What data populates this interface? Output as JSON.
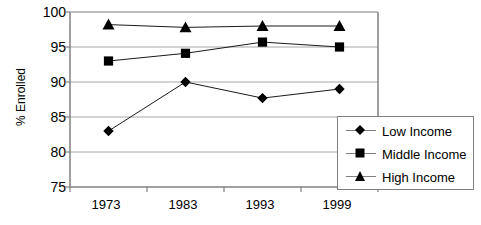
{
  "chart_data": {
    "type": "line",
    "title": "",
    "xlabel": "",
    "ylabel": "% Enrolled",
    "categories": [
      "1973",
      "1983",
      "1993",
      "1999"
    ],
    "ylim": [
      75,
      100
    ],
    "yticks": [
      75,
      80,
      85,
      90,
      95,
      100
    ],
    "ytick_labels": [
      "75",
      "80",
      "85",
      "90",
      "95",
      "100"
    ],
    "grid": true,
    "legend_position": "bottom-right",
    "series": [
      {
        "name": "Low Income",
        "marker": "diamond",
        "values": [
          83,
          90,
          87.7,
          89
        ]
      },
      {
        "name": "Middle Income",
        "marker": "square",
        "values": [
          93,
          94.1,
          95.7,
          95
        ]
      },
      {
        "name": "High Income",
        "marker": "triangle",
        "values": [
          98.2,
          97.8,
          98,
          98
        ]
      }
    ]
  },
  "axes": {
    "y_title": "% Enrolled",
    "y_labels": [
      "100",
      "95",
      "90",
      "85",
      "80",
      "75"
    ],
    "x_labels": [
      "1973",
      "1983",
      "1993",
      "1999"
    ]
  },
  "legend": {
    "entries": [
      {
        "label": "Low Income",
        "marker": "diamond"
      },
      {
        "label": "Middle Income",
        "marker": "square"
      },
      {
        "label": "High Income",
        "marker": "triangle"
      }
    ]
  },
  "colors": {
    "series": "#000000",
    "grid": "#a6a6a6",
    "axis": "#808080",
    "background": "#ffffff",
    "text": "#000000"
  }
}
